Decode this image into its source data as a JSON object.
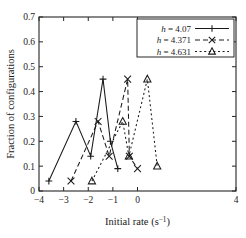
{
  "chart_data": {
    "type": "line",
    "title": "",
    "xlabel": "Initial rate (s⁻¹)",
    "ylabel": "Fraction of configurations",
    "xlim": [
      -4,
      4
    ],
    "ylim": [
      0,
      0.7
    ],
    "xticks": [
      -4,
      -3,
      -2,
      -1,
      0,
      4
    ],
    "xticklabels": [
      "−4",
      "−3",
      "−2",
      "−1",
      "0",
      "4"
    ],
    "yticks": [
      0,
      0.1,
      0.2,
      0.3,
      0.4,
      0.5,
      0.6,
      0.7
    ],
    "yticklabels": [
      "0",
      "0.1",
      "0.2",
      "0.3",
      "0.4",
      "0.5",
      "0.6",
      "0.7"
    ],
    "grid": false,
    "legend_position": "top-right",
    "series": [
      {
        "name": "h = 4.07",
        "h_symbol": "h",
        "h_value": "4.07",
        "marker": "plus",
        "linestyle": "solid",
        "color": "#1a1a1a",
        "x": [
          -3.6,
          -2.5,
          -1.9,
          -1.4,
          -1.1,
          -0.8
        ],
        "y": [
          0.04,
          0.28,
          0.14,
          0.45,
          0.2,
          0.09
        ]
      },
      {
        "name": "h = 4.371",
        "h_symbol": "h",
        "h_value": "4.371",
        "marker": "cross",
        "linestyle": "dashed",
        "color": "#1a1a1a",
        "x": [
          -2.7,
          -1.6,
          -1.15,
          -0.4,
          -0.33,
          0.0
        ],
        "y": [
          0.04,
          0.28,
          0.14,
          0.45,
          0.14,
          0.09
        ]
      },
      {
        "name": "h = 4.631",
        "h_symbol": "h",
        "h_value": "4.631",
        "marker": "triangle",
        "linestyle": "dotted",
        "color": "#1a1a1a",
        "x": [
          -1.85,
          -0.6,
          -0.35,
          0.4,
          0.8
        ],
        "y": [
          0.04,
          0.28,
          0.14,
          0.45,
          0.1
        ]
      }
    ]
  },
  "figure": {
    "background": "#ffffff",
    "foreground": "#1a1a1a"
  }
}
